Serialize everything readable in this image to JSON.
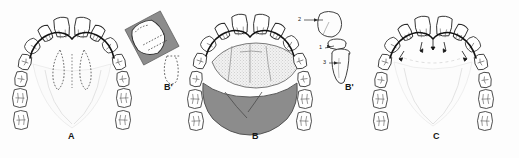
{
  "figure": {
    "background_color": "#fdfdfd",
    "ink_color": "#1a1a1a",
    "shade_dark": "#8f8f8f",
    "shade_light": "#dcdcdc",
    "stipple_color": "#b9b9b9"
  },
  "panels": [
    {
      "id": "A",
      "label": "A",
      "description": "Maxillary arch outline with dotted preparation outline on the palatal aspect"
    },
    {
      "id": "B",
      "label": "B",
      "description": "Maxillary arch with stippled palatal coverage and dark shaded posterior palatal plate"
    },
    {
      "id": "C",
      "label": "C",
      "description": "Maxillary arch with arrow markers along the anterior lingual margin"
    }
  ],
  "insets": [
    {
      "id": "B-prime-left",
      "label": "B'",
      "description": "Sectional view of a prepared tooth with shaded restoration and dotted root outline"
    },
    {
      "id": "B-prime-right",
      "label": "B'",
      "description": "Exploded view of crown, collar and root with numbered leader lines"
    }
  ],
  "callouts": [
    {
      "number": "2",
      "target": "crown"
    },
    {
      "number": "1",
      "target": "collar"
    },
    {
      "number": "3",
      "target": "root"
    }
  ],
  "caption": {
    "text": ""
  }
}
